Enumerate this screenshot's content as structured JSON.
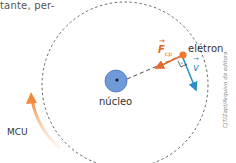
{
  "top_text": "tante, per-",
  "diagram": {
    "nucleus_label": "núcleo",
    "electron_label": "elétron",
    "force_symbol": "F",
    "force_subscript": "cp",
    "velocity_symbol": "v",
    "motion_label": "MCU",
    "credit": "CJT/Zapt/Arquivo da editora"
  },
  "colors": {
    "nucleus_fill": "#6f9ad8",
    "nucleus_stroke": "#4a72b8",
    "electron": "#f07a2a",
    "force_arrow": "#e8682a",
    "velocity_arrow": "#2f8fc8",
    "orbit": "#555555",
    "mcu_arrow": "#f0893a"
  }
}
